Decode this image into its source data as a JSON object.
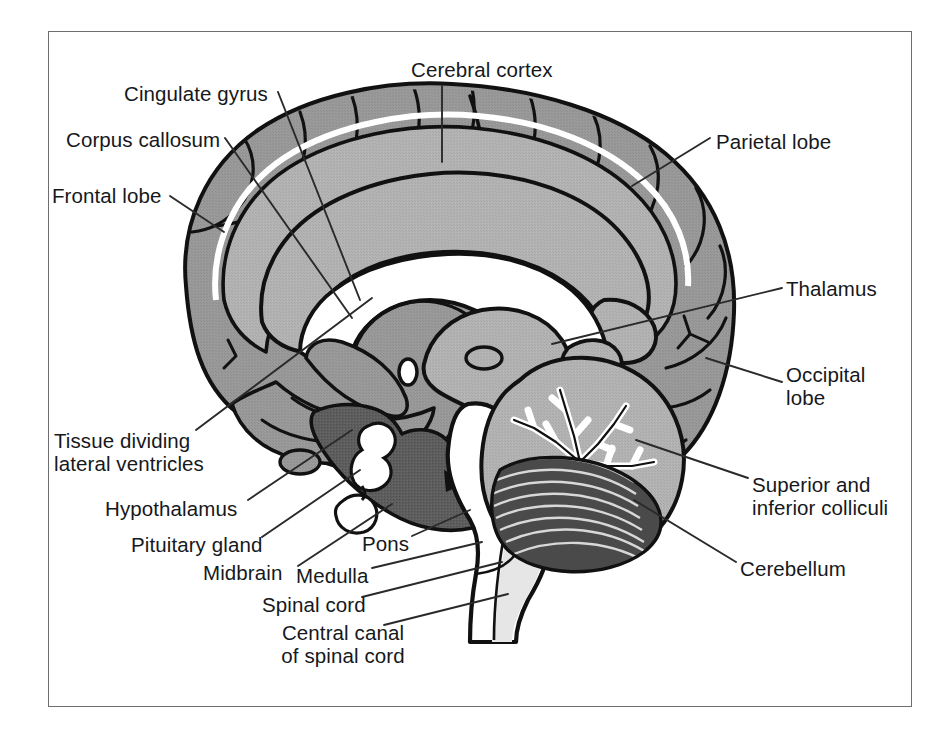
{
  "figure": {
    "type": "anatomical-diagram",
    "frame": {
      "border_color": "#6e6e6e",
      "background": "#ffffff"
    }
  },
  "palette": {
    "cortex_gray": "#9a9a9a",
    "cortex_gray_light": "#a8a8a8",
    "inner_gray": "#b4b4b4",
    "dark_gray": "#585858",
    "mid_dark_gray": "#6f6f6f",
    "white": "#ffffff",
    "outline": "#111111",
    "label_text": "#16181c",
    "leader_line": "#2a2a2a"
  },
  "labels": [
    {
      "id": "cingulate-gyrus",
      "text": "Cingulate gyrus",
      "lines": [
        "Cingulate gyrus"
      ],
      "x": 124,
      "y": 82,
      "align": "left"
    },
    {
      "id": "corpus-callosum",
      "text": "Corpus callosum",
      "lines": [
        "Corpus callosum"
      ],
      "x": 66,
      "y": 128,
      "align": "left"
    },
    {
      "id": "frontal-lobe",
      "text": "Frontal lobe",
      "lines": [
        "Frontal lobe"
      ],
      "x": 52,
      "y": 184,
      "align": "left"
    },
    {
      "id": "cerebral-cortex",
      "text": "Cerebral cortex",
      "lines": [
        "Cerebral cortex"
      ],
      "x": 411,
      "y": 58,
      "align": "left"
    },
    {
      "id": "parietal-lobe",
      "text": "Parietal lobe",
      "lines": [
        "Parietal lobe"
      ],
      "x": 716,
      "y": 130,
      "align": "left"
    },
    {
      "id": "thalamus",
      "text": "Thalamus",
      "lines": [
        "Thalamus"
      ],
      "x": 786,
      "y": 277,
      "align": "left"
    },
    {
      "id": "occipital-lobe",
      "text": "Occipital lobe",
      "lines": [
        "Occipital",
        "lobe"
      ],
      "x": 786,
      "y": 363,
      "align": "left"
    },
    {
      "id": "superior-inferior-colliculi",
      "text": "Superior and inferior colliculi",
      "lines": [
        "Superior and",
        "inferior colliculi"
      ],
      "x": 752,
      "y": 473,
      "align": "left"
    },
    {
      "id": "cerebellum",
      "text": "Cerebellum",
      "lines": [
        "Cerebellum"
      ],
      "x": 740,
      "y": 557,
      "align": "left"
    },
    {
      "id": "tissue-dividing-lateral-ventricles",
      "text": "Tissue dividing lateral ventricles",
      "lines": [
        "Tissue dividing",
        "lateral ventricles"
      ],
      "x": 54,
      "y": 429,
      "align": "left"
    },
    {
      "id": "hypothalamus",
      "text": "Hypothalamus",
      "lines": [
        "Hypothalamus"
      ],
      "x": 105,
      "y": 497,
      "align": "left"
    },
    {
      "id": "pituitary-gland",
      "text": "Pituitary gland",
      "lines": [
        "Pituitary gland"
      ],
      "x": 131,
      "y": 533,
      "align": "left"
    },
    {
      "id": "midbrain",
      "text": "Midbrain",
      "lines": [
        "Midbrain"
      ],
      "x": 203,
      "y": 561,
      "align": "left"
    },
    {
      "id": "pons",
      "text": "Pons",
      "lines": [
        "Pons"
      ],
      "x": 362,
      "y": 532,
      "align": "left"
    },
    {
      "id": "medulla",
      "text": "Medulla",
      "lines": [
        "Medulla"
      ],
      "x": 296,
      "y": 564,
      "align": "left"
    },
    {
      "id": "spinal-cord",
      "text": "Spinal cord",
      "lines": [
        "Spinal cord"
      ],
      "x": 262,
      "y": 593,
      "align": "left"
    },
    {
      "id": "central-canal-of-spinal-cord",
      "text": "Central canal of spinal cord",
      "lines": [
        "Central canal",
        "of spinal cord"
      ],
      "x": 258,
      "y": 621,
      "align": "left"
    }
  ],
  "structures": [
    {
      "id": "cerebral-cortex",
      "name": "Cerebral cortex",
      "fill": "#9a9a9a"
    },
    {
      "id": "frontal-lobe",
      "name": "Frontal lobe",
      "fill": "#9a9a9a"
    },
    {
      "id": "parietal-lobe",
      "name": "Parietal lobe",
      "fill": "#9a9a9a"
    },
    {
      "id": "occipital-lobe",
      "name": "Occipital lobe",
      "fill": "#9a9a9a"
    },
    {
      "id": "cingulate-gyrus",
      "name": "Cingulate gyrus",
      "fill": "#a8a8a8"
    },
    {
      "id": "corpus-callosum",
      "name": "Corpus callosum",
      "fill": "#b4b4b4"
    },
    {
      "id": "lateral-ventricle",
      "name": "Lateral ventricle",
      "fill": "#ffffff"
    },
    {
      "id": "thalamus",
      "name": "Thalamus",
      "fill": "#b4b4b4"
    },
    {
      "id": "hypothalamus",
      "name": "Hypothalamus",
      "fill": "#585858"
    },
    {
      "id": "pituitary-gland",
      "name": "Pituitary gland",
      "fill": "#ffffff"
    },
    {
      "id": "midbrain",
      "name": "Midbrain",
      "fill": "#585858"
    },
    {
      "id": "pons",
      "name": "Pons",
      "fill": "#ffffff"
    },
    {
      "id": "medulla",
      "name": "Medulla",
      "fill": "#ffffff"
    },
    {
      "id": "spinal-cord",
      "name": "Spinal cord",
      "fill": "#e8e8e8"
    },
    {
      "id": "central-canal",
      "name": "Central canal of spinal cord",
      "fill": "#ffffff"
    },
    {
      "id": "cerebellum",
      "name": "Cerebellum",
      "fill": "#b4b4b4"
    },
    {
      "id": "colliculi",
      "name": "Superior and inferior colliculi",
      "fill": "#b4b4b4"
    }
  ]
}
